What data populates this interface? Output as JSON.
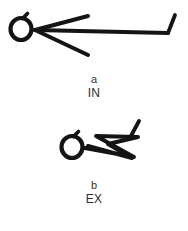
{
  "figure": {
    "background_color": "#ffffff",
    "ink_color": "#141414",
    "panels": [
      {
        "id": "in",
        "letter": "a",
        "name": "IN",
        "description": "stick figure with head and three splayed straight limb lines extending to the right",
        "drawing": {
          "head": {
            "cx": 21,
            "cy": 29,
            "rx": 10.5,
            "ry": 11,
            "stroke_width": 4.2
          },
          "head_tail": {
            "x1": 22.5,
            "y1": 18.5,
            "x2": 27.5,
            "y2": 13.5,
            "stroke_width": 3.6
          },
          "neck_x": 35,
          "neck_y": 30,
          "strokes": [
            {
              "name": "upper-arm",
              "points": "35,30 88,16",
              "stroke_width": 4.0
            },
            {
              "name": "long-arm",
              "points": "35,30 168,33",
              "stroke_width": 4.0
            },
            {
              "name": "lower-arm",
              "points": "35,30 88,55",
              "stroke_width": 4.0
            },
            {
              "name": "right-hook",
              "points": "168,33 175,15",
              "stroke_width": 3.8
            }
          ]
        }
      },
      {
        "id": "ex",
        "letter": "b",
        "name": "EX",
        "description": "stick figure with head and a compressed zigzag of limb lines folded to the right",
        "drawing": {
          "head": {
            "cx": 72,
            "cy": 35,
            "rx": 10.5,
            "ry": 11,
            "stroke_width": 4.2
          },
          "head_tail": {
            "x1": 73.5,
            "y1": 24.5,
            "x2": 78.5,
            "y2": 19.5,
            "stroke_width": 3.6
          },
          "neck_x": 85,
          "neck_y": 36,
          "strokes": [
            {
              "name": "zigzag-body",
              "points": "85,36 134,45 96,24 138,25 108,32 132,46 88,34",
              "stroke_width": 3.9
            },
            {
              "name": "right-hook",
              "points": "131,24 139,9",
              "stroke_width": 3.8
            }
          ]
        }
      }
    ]
  }
}
